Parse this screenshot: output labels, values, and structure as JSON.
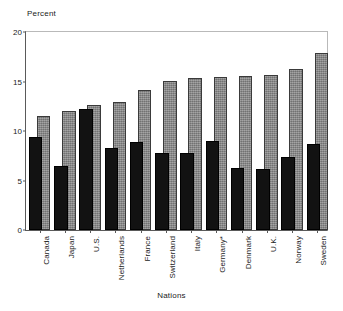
{
  "chart_data": {
    "type": "bar",
    "title": "",
    "xlabel": "Nations",
    "ylabel": "Percent",
    "ylim": [
      0,
      20
    ],
    "yticks": [
      0,
      5,
      10,
      15,
      20
    ],
    "ytick_labels": [
      "0",
      "5",
      "10",
      "15",
      "20"
    ],
    "grid": false,
    "legend": "none",
    "orientation": "vertical",
    "bar_style": "overlapping pairs, dark front bar and gray back bar",
    "categories": [
      "Canada",
      "Japan",
      "U.S.",
      "Netherlands",
      "France",
      "Switzerland",
      "Italy",
      "Germany*",
      "Denmark",
      "U.K.",
      "Norway",
      "Sweden"
    ],
    "series": [
      {
        "name": "dark-front-bar",
        "color": "#121212",
        "values": [
          9.4,
          6.5,
          12.2,
          8.3,
          8.9,
          7.8,
          7.8,
          9.0,
          6.3,
          6.2,
          7.4,
          8.7
        ]
      },
      {
        "name": "gray-back-bar",
        "color": "#8a8a8a",
        "values": [
          11.5,
          12.0,
          12.6,
          12.9,
          14.1,
          15.1,
          15.4,
          15.5,
          15.6,
          15.7,
          16.3,
          17.9
        ]
      }
    ],
    "annotations": [
      "* Germany marked with asterisk footnote"
    ]
  }
}
